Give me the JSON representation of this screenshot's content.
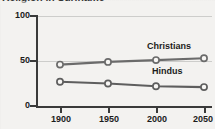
{
  "chart_data": {
    "type": "line",
    "title": "Religion in Suriname",
    "xlabel": "",
    "ylabel": "",
    "x": [
      1900,
      1950,
      2000,
      2050
    ],
    "xtick_labels": [
      "1900",
      "1950",
      "2000",
      "2050"
    ],
    "ytick_labels": [
      "0",
      "50",
      "100"
    ],
    "yticks": [
      0,
      50,
      100
    ],
    "ylim": [
      0,
      100
    ],
    "xlim": [
      1875,
      2075
    ],
    "grid": "horizontal-faint",
    "legend_position": "inline-above-series",
    "marker": "open-circle",
    "series": [
      {
        "name": "Christians",
        "label": "Christians",
        "values": [
          46,
          49,
          51,
          53
        ],
        "color": "#6b6b6b"
      },
      {
        "name": "Hindus",
        "label": "Hindus",
        "values": [
          27,
          25,
          22,
          21
        ],
        "color": "#5e5e5e"
      }
    ]
  },
  "axis": {
    "y": {
      "t100": "100",
      "t50": "50",
      "t0": "0"
    },
    "x": {
      "t1900": "1900",
      "t1950": "1950",
      "t2000": "2000",
      "t2050": "2050"
    }
  },
  "labels": {
    "christians": "Christians",
    "hindus": "Hindus"
  },
  "colors": {
    "background": "#f3f2f0",
    "axis": "#3a3a3a",
    "text": "#1b1b1b",
    "gridline": "#bdbdbd",
    "series_christians": "#6b6b6b",
    "series_hindus": "#5e5e5e",
    "marker_fill": "#f7f6f4"
  }
}
